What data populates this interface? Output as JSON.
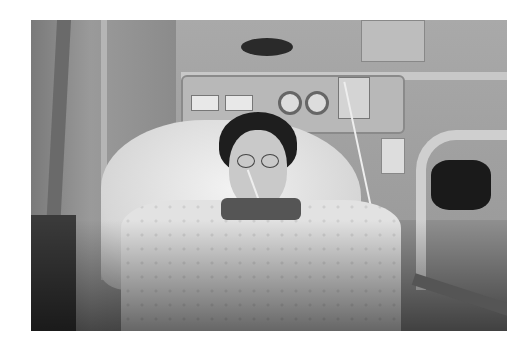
{
  "image": {
    "description": "Grayscale photograph of a patient lying in a hospital bed with a nasal feeding tube, wearing glasses and a patterned hospital gown, surrounded by medical equipment (headwall panel with outlets and gauges, monitor, IV bag, bed rail).",
    "style": "black-and-white photo on white page",
    "colors": {
      "page": "#ffffff",
      "photo_mid": "#8f8f8f",
      "dark": "#1e1e1e",
      "light": "#f2f2f2"
    }
  }
}
